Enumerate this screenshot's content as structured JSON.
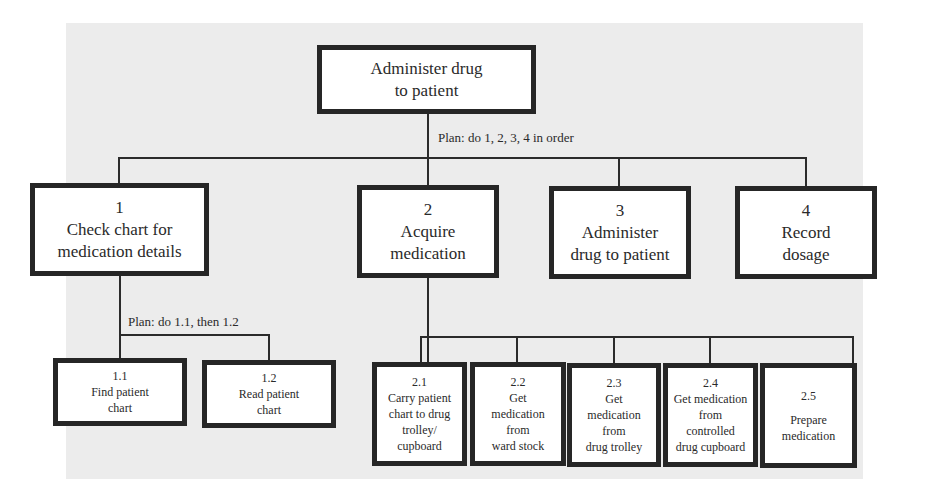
{
  "diagram": {
    "type": "hierarchical-task-analysis",
    "root": {
      "label_line1": "Administer drug",
      "label_line2": "to patient"
    },
    "root_plan": "Plan: do 1, 2, 3, 4 in order",
    "tasks": [
      {
        "id": "1",
        "line1": "Check chart for",
        "line2": "medication details"
      },
      {
        "id": "2",
        "line1": "Acquire",
        "line2": "medication"
      },
      {
        "id": "3",
        "line1": "Administer",
        "line2": "drug to patient"
      },
      {
        "id": "4",
        "line1": "Record",
        "line2": "dosage"
      }
    ],
    "task1_plan": "Plan: do 1.1, then 1.2",
    "task1_subtasks": [
      {
        "id": "1.1",
        "line1": "Find patient",
        "line2": "chart"
      },
      {
        "id": "1.2",
        "line1": "Read patient",
        "line2": "chart"
      }
    ],
    "task2_subtasks": [
      {
        "id": "2.1",
        "lines": [
          "Carry patient",
          "chart to drug",
          "trolley/",
          "cupboard"
        ]
      },
      {
        "id": "2.2",
        "lines": [
          "Get",
          "medication",
          "from",
          "ward stock"
        ]
      },
      {
        "id": "2.3",
        "lines": [
          "Get",
          "medication",
          "from",
          "drug trolley"
        ]
      },
      {
        "id": "2.4",
        "lines": [
          "Get medication",
          "from",
          "controlled",
          "drug cupboard"
        ]
      },
      {
        "id": "2.5",
        "lines": [
          "Prepare",
          "medication"
        ]
      }
    ]
  },
  "colors": {
    "panel_background": "#ececec",
    "box_border": "#262626",
    "box_fill": "#ffffff",
    "text": "#2a2a2a"
  }
}
